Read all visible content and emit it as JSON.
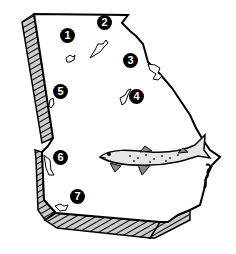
{
  "map": {
    "region": "Georgia",
    "colors": {
      "outline": "#000000",
      "land": "#ffffff",
      "hatch_fill": "#cccccc",
      "marker_bg": "#000000",
      "marker_text": "#ffffff",
      "fish_body": "#e6e6e6"
    },
    "markers": [
      {
        "id": 1,
        "label": "1",
        "x": 67,
        "y": 35
      },
      {
        "id": 2,
        "label": "2",
        "x": 104,
        "y": 22
      },
      {
        "id": 3,
        "label": "3",
        "x": 130,
        "y": 60
      },
      {
        "id": 4,
        "label": "4",
        "x": 136,
        "y": 96
      },
      {
        "id": 5,
        "label": "5",
        "x": 60,
        "y": 91
      },
      {
        "id": 6,
        "label": "6",
        "x": 60,
        "y": 157
      },
      {
        "id": 7,
        "label": "7",
        "x": 77,
        "y": 196
      }
    ],
    "illustration": "fish-icon"
  }
}
